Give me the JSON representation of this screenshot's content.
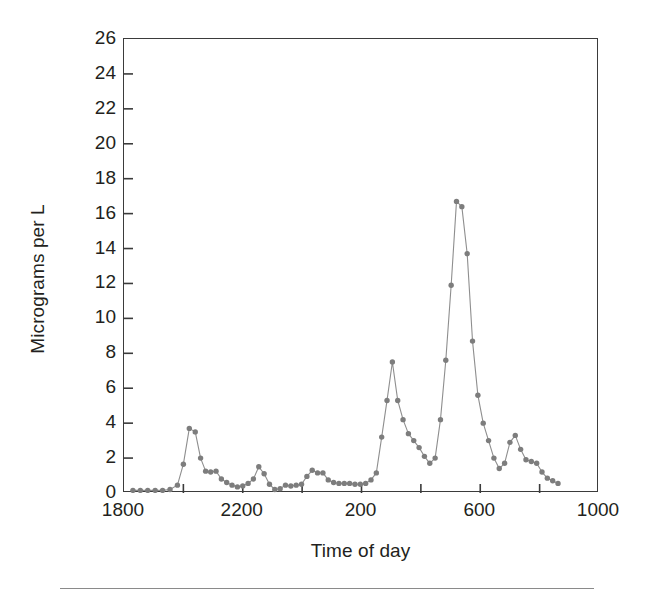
{
  "chart_data": {
    "type": "line",
    "title": "",
    "xlabel": "Time of day",
    "ylabel": "Micrograms per L",
    "ylim": [
      0,
      26
    ],
    "ytick_step": 2,
    "yticks": [
      0,
      2,
      4,
      6,
      8,
      10,
      12,
      14,
      16,
      18,
      20,
      22,
      24,
      26
    ],
    "xticks": [
      1800,
      2200,
      200,
      600,
      1000
    ],
    "xtick_labels": [
      "1800",
      "2200",
      "200",
      "600",
      "1000"
    ],
    "x_minor_ticks_between": 1,
    "grid": false,
    "legend": null,
    "marker": "filled-circle",
    "marker_color": "#7d7d7d",
    "line_color": "#8e8e8e",
    "frame_color": "#3b3b3b",
    "x_axis_note": "Clock time running 1800 through 1000 the next day; elapsed minutes from 1800 used for plotting.",
    "x_minutes": [
      30,
      55,
      80,
      105,
      130,
      155,
      180,
      200,
      220,
      240,
      258,
      275,
      292,
      310,
      328,
      346,
      364,
      382,
      400,
      418,
      436,
      454,
      472,
      490,
      508,
      526,
      544,
      562,
      580,
      598,
      616,
      634,
      652,
      670,
      688,
      706,
      724,
      742,
      760,
      778,
      796,
      814,
      832,
      850,
      868,
      886,
      904,
      922,
      940,
      958,
      976,
      994,
      1012,
      1030,
      1048,
      1066,
      1084,
      1102,
      1120,
      1138,
      1156,
      1174,
      1192,
      1210,
      1228,
      1246,
      1264,
      1282,
      1300,
      1318,
      1336,
      1354,
      1372,
      1390,
      1408,
      1426,
      1444,
      1462
    ],
    "values": [
      0.15,
      0.15,
      0.15,
      0.15,
      0.15,
      0.2,
      0.45,
      1.65,
      3.7,
      3.5,
      2.0,
      1.25,
      1.2,
      1.25,
      0.8,
      0.6,
      0.45,
      0.35,
      0.4,
      0.55,
      0.8,
      1.5,
      1.1,
      0.5,
      0.2,
      0.25,
      0.45,
      0.4,
      0.45,
      0.5,
      0.95,
      1.3,
      1.15,
      1.15,
      0.75,
      0.6,
      0.55,
      0.55,
      0.55,
      0.5,
      0.5,
      0.55,
      0.75,
      1.15,
      3.2,
      5.3,
      7.5,
      5.3,
      4.2,
      3.4,
      3.0,
      2.6,
      2.1,
      1.7,
      2.0,
      4.2,
      7.6,
      11.9,
      16.7,
      16.4,
      13.7,
      8.7,
      5.6,
      4.0,
      3.0,
      2.0,
      1.4,
      1.7,
      2.9,
      3.3,
      2.5,
      1.9,
      1.8,
      1.7,
      1.2,
      0.85,
      0.7,
      0.55
    ]
  },
  "axes": {
    "y_title": "Micrograms per L",
    "x_title": "Time of day"
  }
}
